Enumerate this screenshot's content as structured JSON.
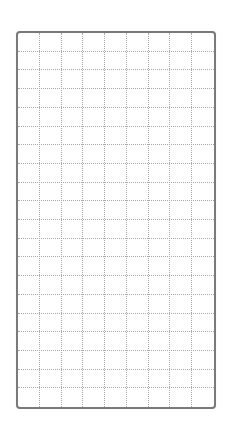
{
  "grid": {
    "columns": 9,
    "rows": 20,
    "frame_color": "#7a7a7a",
    "line_color": "#a8a8a8",
    "line_style": "dotted",
    "background": "#ffffff"
  }
}
